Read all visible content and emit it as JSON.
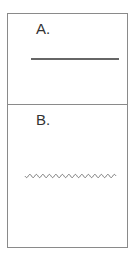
{
  "panels": [
    {
      "label": "A.",
      "line_type": "straight"
    },
    {
      "label": "B.",
      "line_type": "wavy"
    }
  ],
  "colors": {
    "border": "#8a8a8a",
    "line_a": "#333333",
    "line_b": "#777777"
  }
}
